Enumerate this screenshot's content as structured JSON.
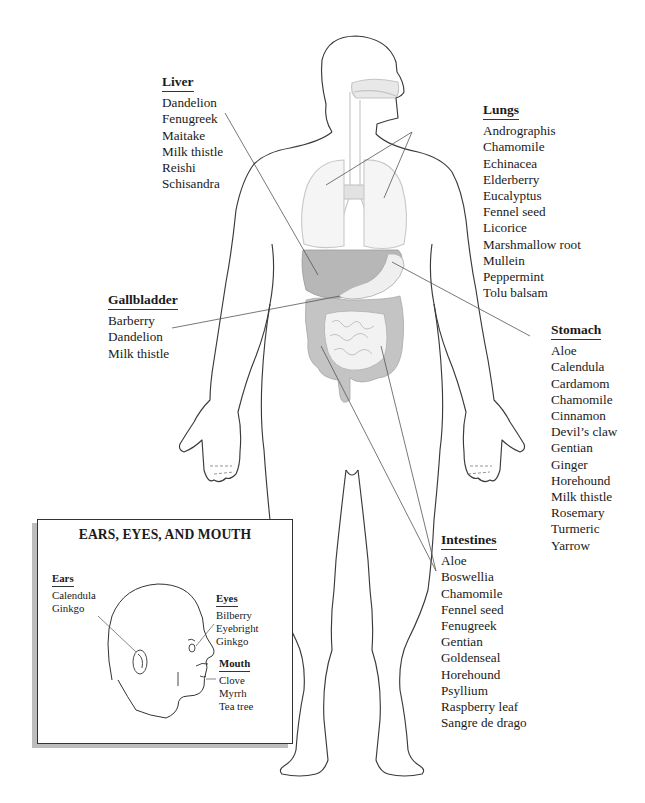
{
  "figure": {
    "type": "anatomical-herb-map",
    "colors": {
      "outline": "#3a3a3a",
      "organ_fill": "#b9b9b9",
      "light_organ": "#e6e6e6",
      "leader_line": "#555555",
      "inset_shadow": "#bdbdbd"
    }
  },
  "organs": {
    "liver": {
      "title": "Liver",
      "herbs": [
        "Dandelion",
        "Fenugreek",
        "Maitake",
        "Milk thistle",
        "Reishi",
        "Schisandra"
      ]
    },
    "lungs": {
      "title": "Lungs",
      "herbs": [
        "Andrographis",
        "Chamomile",
        "Echinacea",
        "Elderberry",
        "Eucalyptus",
        "Fennel seed",
        "Licorice",
        "Marshmallow root",
        "Mullein",
        "Peppermint",
        "Tolu balsam"
      ]
    },
    "gallbladder": {
      "title": "Gallbladder",
      "herbs": [
        "Barberry",
        "Dandelion",
        "Milk thistle"
      ]
    },
    "stomach": {
      "title": "Stomach",
      "herbs": [
        "Aloe",
        "Calendula",
        "Cardamom",
        "Chamomile",
        "Cinnamon",
        "Devil’s claw",
        "Gentian",
        "Ginger",
        "Horehound",
        "Milk thistle",
        "Rosemary",
        "Turmeric",
        "Yarrow"
      ]
    },
    "intestines": {
      "title": "Intestines",
      "herbs": [
        "Aloe",
        "Boswellia",
        "Chamomile",
        "Fennel seed",
        "Fenugreek",
        "Gentian",
        "Goldenseal",
        "Horehound",
        "Psyllium",
        "Raspberry leaf",
        "Sangre de drago"
      ]
    }
  },
  "inset": {
    "title": "EARS, EYES, AND MOUTH",
    "ears": {
      "title": "Ears",
      "herbs": [
        "Calendula",
        "Ginkgo"
      ]
    },
    "eyes": {
      "title": "Eyes",
      "herbs": [
        "Bilberry",
        "Eyebright",
        "Ginkgo"
      ]
    },
    "mouth": {
      "title": "Mouth",
      "herbs": [
        "Clove",
        "Myrrh",
        "Tea tree"
      ]
    }
  }
}
